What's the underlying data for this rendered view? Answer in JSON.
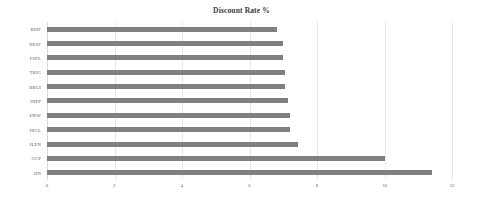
{
  "chart_data": {
    "type": "bar",
    "orientation": "horizontal",
    "title": "Discount Rate %",
    "xlabel": "",
    "ylabel": "",
    "xlim": [
      0,
      12
    ],
    "xticks": [
      0,
      2,
      4,
      6,
      8,
      10,
      12
    ],
    "xtick_labels": [
      "0",
      "2",
      "4",
      "6",
      "8",
      "10",
      "12"
    ],
    "grid": true,
    "grid_axis": "x",
    "legend": false,
    "bar_color": "#808080",
    "categories": [
      "BSIF",
      "NESF",
      "FSFL",
      "TRIG",
      "BBGI",
      "INPP",
      "UKW",
      "HICL",
      "JLEN",
      "GCP",
      "3IN"
    ],
    "values": [
      6.8,
      7.0,
      7.0,
      7.05,
      7.05,
      7.15,
      7.2,
      7.2,
      7.45,
      10.0,
      11.4
    ]
  }
}
